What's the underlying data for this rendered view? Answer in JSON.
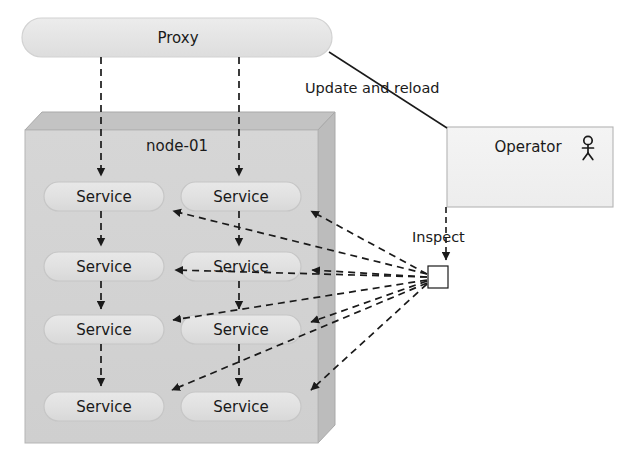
{
  "diagram": {
    "title_nodes": {
      "proxy": {
        "label": "Proxy",
        "shape": "stadium"
      },
      "node_container": {
        "label": "node-01",
        "shape": "3d-box"
      },
      "operator": {
        "label": "Operator",
        "icon": "actor-stick-figure-icon",
        "shape": "rectangle"
      },
      "inspect_point": {
        "label": "",
        "shape": "small-square"
      }
    },
    "services": [
      {
        "id": "svc-r1c1",
        "label": "Service",
        "row": 1,
        "col": 1
      },
      {
        "id": "svc-r1c2",
        "label": "Service",
        "row": 1,
        "col": 2
      },
      {
        "id": "svc-r2c1",
        "label": "Service",
        "row": 2,
        "col": 1
      },
      {
        "id": "svc-r2c2",
        "label": "Service",
        "row": 2,
        "col": 2
      },
      {
        "id": "svc-r3c1",
        "label": "Service",
        "row": 3,
        "col": 1
      },
      {
        "id": "svc-r3c2",
        "label": "Service",
        "row": 3,
        "col": 2
      },
      {
        "id": "svc-r4c1",
        "label": "Service",
        "row": 4,
        "col": 1
      },
      {
        "id": "svc-r4c2",
        "label": "Service",
        "row": 4,
        "col": 2
      }
    ],
    "edge_labels": {
      "update_and_reload": "Update and reload",
      "inspect": "Inspect"
    },
    "colors": {
      "stroke": "#1a1a1a",
      "node_fill": "#d2d2d2",
      "node_top_fill": "#c2c2c2",
      "node_side_fill": "#bdbdbd",
      "service_fill": "#e2e2e2",
      "service_stroke": "#c8c8c8",
      "proxy_fill": "#e6e6e6",
      "proxy_stroke": "#d0d0d0",
      "operator_fill": "#f2f2f2",
      "operator_stroke": "#b4b4b4",
      "text": "#1a1a1a",
      "background": "#ffffff"
    }
  }
}
